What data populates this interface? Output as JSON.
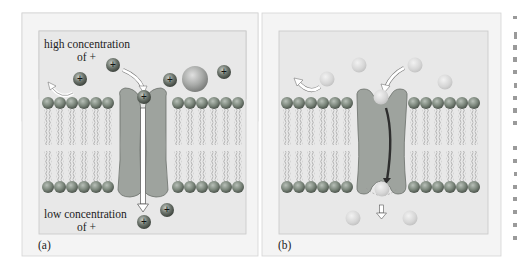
{
  "figure": {
    "panels": [
      {
        "id": "a",
        "label": "(a)",
        "top_label_line1": "high concentration",
        "top_label_line2": "of +",
        "bottom_label_line1": "low concentration",
        "bottom_label_line2": "of +",
        "ion_symbol": "+"
      },
      {
        "id": "b",
        "label": "(b)"
      }
    ],
    "colors": {
      "panel_outer": "#f4f4f4",
      "panel_inner": "#e6e6e6",
      "panel_border": "#cccccc",
      "lipid_head": "#7e8a7e",
      "protein": "#9ea39e",
      "protein_stroke": "#6a6f6a",
      "ion_dark": "#5a625a",
      "ion_light": "#d8d8d8",
      "pathway_arrow": "#333333"
    }
  }
}
